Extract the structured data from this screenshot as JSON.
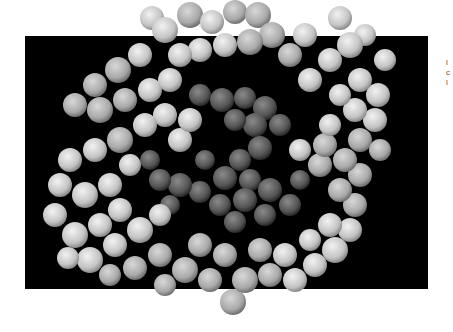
{
  "figure": {
    "background_color": "#000000",
    "page_color": "#ffffff",
    "outer_ring_color": "#cfcfcf",
    "inner_core_color": "#5a5a5a"
  },
  "edge_text": {
    "line1": "l",
    "line2": "c",
    "line3": "l"
  }
}
